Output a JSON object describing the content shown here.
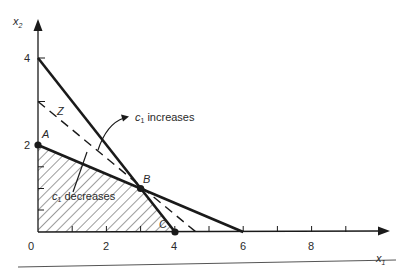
{
  "diagram": {
    "type": "linear-programming-feasible-region",
    "axes": {
      "x_label": "x",
      "x_label_sub": "1",
      "y_label": "x",
      "y_label_sub": "2",
      "origin_label": "0",
      "x_ticks": [
        {
          "value": 2,
          "label": "2"
        },
        {
          "value": 4,
          "label": "4"
        },
        {
          "value": 6,
          "label": "6"
        },
        {
          "value": 8,
          "label": "8"
        }
      ],
      "y_ticks": [
        {
          "value": 2,
          "label": "2"
        },
        {
          "value": 4,
          "label": "4"
        }
      ]
    },
    "points": {
      "A": {
        "label": "A",
        "x1": 0,
        "x2": 2
      },
      "B": {
        "label": "B",
        "x1": 3,
        "x2": 1
      },
      "C": {
        "label": "C",
        "x1": 4,
        "x2": 0
      }
    },
    "constraint_lines": [
      {
        "name": "constraint-1",
        "from": [
          0,
          4
        ],
        "to": [
          4,
          0
        ],
        "style": "solid-thick"
      },
      {
        "name": "constraint-2",
        "from": [
          0,
          2
        ],
        "to": [
          6,
          0
        ],
        "style": "solid-thick"
      }
    ],
    "objective_line": {
      "label": "Z",
      "from": [
        0,
        3
      ],
      "to": [
        4.6,
        0
      ],
      "style": "dashed"
    },
    "feasible_region": {
      "vertices": [
        [
          0,
          0
        ],
        [
          0,
          2
        ],
        [
          3,
          1
        ],
        [
          4,
          0
        ]
      ],
      "fill": "hatched"
    },
    "annotations": {
      "increases": {
        "prefix": "c",
        "sub": "1",
        "text": "increases"
      },
      "decreases": {
        "prefix": "c",
        "sub": "1",
        "text": "decreases"
      }
    },
    "colors": {
      "ink": "#1a1a1a",
      "hatch": "#3a3a3a",
      "rule": "#555555"
    }
  }
}
